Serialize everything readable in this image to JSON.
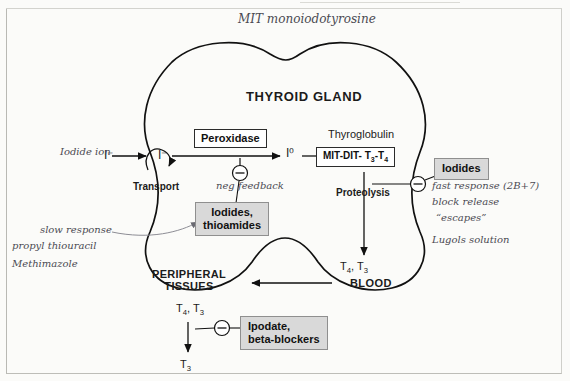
{
  "diagram": {
    "title": "THYROID GLAND",
    "handwritten_top": "MIT monoiodotyrosine",
    "printed_labels": {
      "peroxidase": "Peroxidase",
      "thyroglobulin": "Thyroglobulin",
      "mit_dit": "MIT-DIT- T3-T4",
      "transport": "Transport",
      "proteolysis": "Proteolysis",
      "iodides_box": "Iodides",
      "iodides_thioamides_box": "Iodides,\nthioamides",
      "ipodate_box": "Ipodate,\nbeta-blockers",
      "peripheral_tissues": "PERIPHERAL\nTISSUES",
      "blood": "BLOOD",
      "t4_t3_blood": "T4, T3",
      "t4_t3_tissue": "T4, T3",
      "t3_final": "T3",
      "iodide_minus_1": "I⁻",
      "iodide_minus_2": "I⁻",
      "iodine_zero": "I⁰"
    },
    "handwritten_notes": {
      "iodide_ion": "Iodide ion",
      "neg_feedback": "neg feedback",
      "slow_response": "slow response",
      "propyl_thiouracil": "propyl thiouracil",
      "methimazole": "Methimazole",
      "fast_response": "fast response (2B+7)",
      "block_release": "block release",
      "escapes": "“escapes”",
      "lugols": "Lugols solution"
    },
    "colors": {
      "ink_print": "#1b1b1b",
      "ink_hand": "#4a4a52",
      "shade_box": "#d9d9d9",
      "gland_outline": "#111111"
    }
  }
}
